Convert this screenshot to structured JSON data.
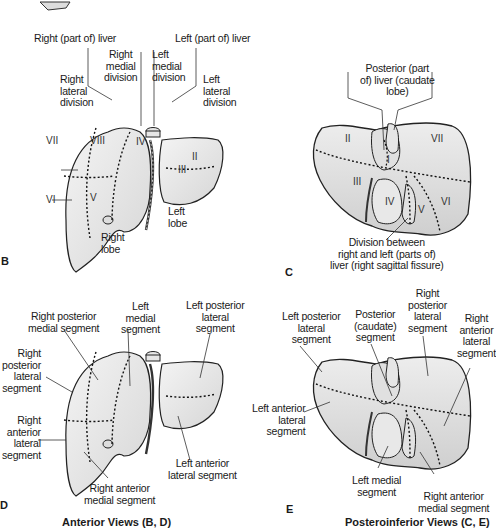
{
  "figure": {
    "panels": {
      "B": {
        "letter": "B",
        "view": "anterior",
        "division_labels": {
          "right_part": "Right (part of) liver",
          "left_part": "Left (part of) liver",
          "right_medial": "Right\nmedial\ndivision",
          "left_medial": "Left\nmedial\ndivision",
          "right_lateral": "Right\nlateral\ndivision",
          "left_lateral": "Left\nlateral\ndivision"
        },
        "segments": [
          "II",
          "III",
          "IV",
          "V",
          "VI",
          "VII",
          "VIII"
        ],
        "lobe_labels": {
          "right": "Right\nlobe",
          "left": "Left\nlobe"
        }
      },
      "C": {
        "letter": "C",
        "view": "posteroinferior",
        "top_label": "Posterior (part\nof) liver (caudate\nlobe)",
        "bottom_label": "Division between\nright and left (parts of)\nliver (right sagittal fissure)",
        "segments": [
          "I",
          "II",
          "III",
          "IV",
          "V",
          "VI",
          "VII"
        ]
      },
      "D": {
        "letter": "D",
        "view": "anterior",
        "labels": {
          "right_posterior_medial": "Right posterior\nmedial segment",
          "left_medial": "Left\nmedial\nsegment",
          "left_posterior_lateral": "Left posterior\nlateral\nsegment",
          "right_posterior_lateral": "Right\nposterior\nlateral\nsegment",
          "right_anterior_lateral": "Right\nanterior\nlateral\nsegment",
          "right_anterior_medial": "Right anterior\nmedial segment",
          "left_anterior_lateral": "Left anterior\nlateral segment"
        }
      },
      "E": {
        "letter": "E",
        "view": "posteroinferior",
        "labels": {
          "left_posterior_lateral": "Left posterior\nlateral\nsegment",
          "posterior_caudate": "Posterior\n(caudate)\nsegment",
          "right_posterior_lateral": "Right\nposterior\nlateral\nsegment",
          "right_anterior_lateral": "Right\nanterior\nlateral\nsegment",
          "left_anterior_lateral": "Left anterior\nlateral\nsegment",
          "left_medial": "Left medial\nsegment",
          "right_anterior_medial": "Right anterior\nmedial segment"
        }
      }
    },
    "captions": {
      "anterior": "Anterior Views (B, D)",
      "posteroinferior": "Posteroinferior Views (C, E)"
    },
    "colors": {
      "liver_fill": "#ececec",
      "liver_shade": "#d4d4d4",
      "outline": "#222222",
      "text": "#1a1a1a"
    }
  }
}
